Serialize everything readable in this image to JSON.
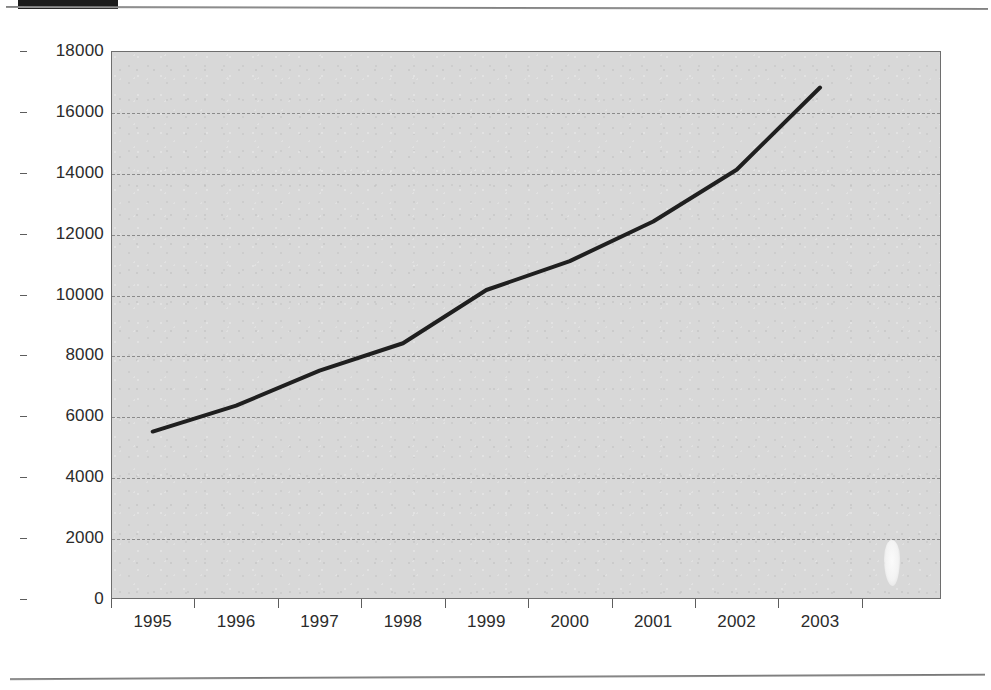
{
  "page": {
    "tab_marker": "",
    "top_rule": "",
    "bottom_rule": ""
  },
  "chart_data": {
    "type": "line",
    "title": "",
    "subtitle": "",
    "xlabel": "",
    "ylabel": "",
    "categories": [
      "1995",
      "1996",
      "1997",
      "1998",
      "1999",
      "2000",
      "2001",
      "2002",
      "2003"
    ],
    "x": [
      1995,
      1996,
      1997,
      1998,
      1999,
      2000,
      2001,
      2002,
      2003
    ],
    "values": [
      5500,
      6350,
      7500,
      8400,
      10150,
      11100,
      12400,
      14100,
      16800
    ],
    "series": [
      {
        "name": "",
        "values": [
          5500,
          6350,
          7500,
          8400,
          10150,
          11100,
          12400,
          14100,
          16800
        ]
      }
    ],
    "ylim": [
      0,
      18000
    ],
    "ytick_labels": [
      "0",
      "2000",
      "4000",
      "6000",
      "8000",
      "10000",
      "12000",
      "14000",
      "16000",
      "18000"
    ],
    "yticks": [
      0,
      2000,
      4000,
      6000,
      8000,
      10000,
      12000,
      14000,
      16000,
      18000
    ],
    "xtick_labels": [
      "1995",
      "1996",
      "1997",
      "1998",
      "1999",
      "2000",
      "2001",
      "2002",
      "2003"
    ],
    "grid": true,
    "grid_style": "dashed-horizontal",
    "legend": false,
    "legend_position": "none",
    "annotations": [],
    "colors": {
      "line": "#1f1f1f",
      "plot_background": "#d8d8d8",
      "axis": "#5d5d5d",
      "gridline": "#8b8b8b",
      "text": "#2b2b2b",
      "page_background": "#ffffff"
    }
  }
}
